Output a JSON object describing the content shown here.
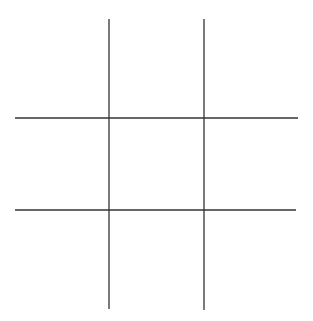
{
  "canvas": {
    "width": 313,
    "height": 321,
    "background_color": "#ffffff"
  },
  "board": {
    "name": "tic-tac-toe-grid",
    "title": "Tic-Tac-Toe Board",
    "state": "empty",
    "rows": 3,
    "columns": 3,
    "line_color": "#333333",
    "line_width": 1.3,
    "marks": [
      {
        "cell": "top-left",
        "value": ""
      },
      {
        "cell": "top-center",
        "value": ""
      },
      {
        "cell": "top-right",
        "value": ""
      },
      {
        "cell": "middle-left",
        "value": ""
      },
      {
        "cell": "middle-center",
        "value": ""
      },
      {
        "cell": "middle-right",
        "value": ""
      },
      {
        "cell": "bottom-left",
        "value": ""
      },
      {
        "cell": "bottom-center",
        "value": ""
      },
      {
        "cell": "bottom-right",
        "value": ""
      }
    ]
  },
  "chart_data": {
    "type": "line",
    "title": "",
    "xlabel": "",
    "ylabel": "",
    "grid": true,
    "legend": "none",
    "xlim": [
      0,
      313
    ],
    "ylim": [
      0,
      321
    ],
    "series": [
      {
        "name": "vertical-line-left",
        "orientation": "vertical",
        "x": [
          109,
          109
        ],
        "y": [
          19,
          309
        ]
      },
      {
        "name": "vertical-line-right",
        "orientation": "vertical",
        "x": [
          204,
          204
        ],
        "y": [
          19,
          310
        ]
      },
      {
        "name": "horizontal-line-top",
        "orientation": "horizontal",
        "x": [
          15,
          298
        ],
        "y": [
          118,
          118
        ]
      },
      {
        "name": "horizontal-line-bottom",
        "orientation": "horizontal",
        "x": [
          15,
          296
        ],
        "y": [
          210,
          210
        ]
      }
    ],
    "intersections": [
      {
        "name": "top-left-intersection",
        "x": 109,
        "y": 118
      },
      {
        "name": "top-right-intersection",
        "x": 204,
        "y": 118
      },
      {
        "name": "bottom-left-intersection",
        "x": 109,
        "y": 210
      },
      {
        "name": "bottom-right-intersection",
        "x": 204,
        "y": 210
      }
    ]
  },
  "cells": [
    {
      "name": "cell-top-left",
      "x": 15,
      "y": 19,
      "w": 94,
      "h": 99,
      "label": ""
    },
    {
      "name": "cell-top-center",
      "x": 109,
      "y": 19,
      "w": 95,
      "h": 99,
      "label": ""
    },
    {
      "name": "cell-top-right",
      "x": 204,
      "y": 19,
      "w": 94,
      "h": 99,
      "label": ""
    },
    {
      "name": "cell-middle-left",
      "x": 15,
      "y": 118,
      "w": 94,
      "h": 92,
      "label": ""
    },
    {
      "name": "cell-middle-center",
      "x": 109,
      "y": 118,
      "w": 95,
      "h": 92,
      "label": ""
    },
    {
      "name": "cell-middle-right",
      "x": 204,
      "y": 118,
      "w": 94,
      "h": 92,
      "label": ""
    },
    {
      "name": "cell-bottom-left",
      "x": 15,
      "y": 210,
      "w": 94,
      "h": 100,
      "label": ""
    },
    {
      "name": "cell-bottom-center",
      "x": 109,
      "y": 210,
      "w": 95,
      "h": 100,
      "label": ""
    },
    {
      "name": "cell-bottom-right",
      "x": 204,
      "y": 210,
      "w": 94,
      "h": 100,
      "label": ""
    }
  ]
}
